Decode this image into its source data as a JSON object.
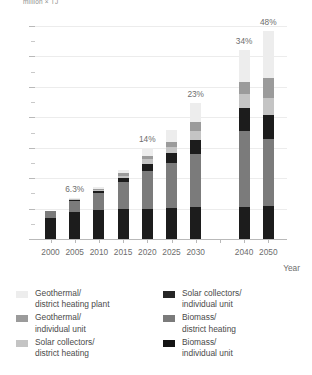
{
  "chart_data": {
    "type": "bar",
    "subtype": "stacked-bar",
    "title": "",
    "unit_label": "million × TJ",
    "xlabel": "Year",
    "ylabel": "",
    "ylim": [
      0,
      350
    ],
    "yticks": [
      0,
      50,
      100,
      150,
      200,
      250,
      300,
      350
    ],
    "ytick_minor_step": 25,
    "grid": true,
    "legend_position": "bottom",
    "categories": [
      "2000",
      "2005",
      "2010",
      "2015",
      "2020",
      "2025",
      "2030",
      "2040",
      "2050"
    ],
    "annotations": [
      {
        "category": "2005",
        "text": "6.3%"
      },
      {
        "category": "2020",
        "text": "14%"
      },
      {
        "category": "2030",
        "text": "23%"
      },
      {
        "category": "2040",
        "text": "34%"
      },
      {
        "category": "2050",
        "text": "48%"
      }
    ],
    "series": [
      {
        "name": "Biomass/\nindividual unit",
        "color": "#1c1c1c",
        "values": [
          34,
          44,
          48,
          49,
          50,
          51,
          52,
          53,
          54
        ]
      },
      {
        "name": "Biomass/\ndistrict heating",
        "color": "#7b7b7b",
        "values": [
          12,
          18,
          28,
          45,
          62,
          74,
          88,
          125,
          110
        ]
      },
      {
        "name": "Solar collectors/\nindividual unit",
        "color": "#1c1c1c",
        "values": [
          0,
          2,
          3,
          6,
          12,
          16,
          22,
          38,
          40
        ]
      },
      {
        "name": "Solar collectors/\ndistrict heating",
        "color": "#c4c4c4",
        "values": [
          0,
          1,
          2,
          4,
          7,
          10,
          16,
          22,
          28
        ]
      },
      {
        "name": "Geothermal/\nindividual unit",
        "color": "#9b9b9b",
        "values": [
          0,
          1,
          2,
          4,
          6,
          9,
          14,
          20,
          32
        ]
      },
      {
        "name": "Geothermal/\ndistrict heating plant",
        "color": "#ededed",
        "values": [
          0,
          1,
          3,
          6,
          12,
          20,
          32,
          52,
          78
        ]
      }
    ]
  },
  "legend": {
    "left_column": [
      {
        "label": "Geothermal/\ndistrict heating plant",
        "color": "#ededed"
      },
      {
        "label": "Geothermal/\nindividual unit",
        "color": "#9b9b9b"
      },
      {
        "label": "Solar collectors/\ndistrict heating",
        "color": "#c4c4c4"
      }
    ],
    "right_column": [
      {
        "label": "Solar collectors/\nindividual unit",
        "color": "#262626"
      },
      {
        "label": "Biomass/\ndistrict heating",
        "color": "#7b7b7b"
      },
      {
        "label": "Biomass/\nindividual unit",
        "color": "#141414"
      }
    ]
  }
}
